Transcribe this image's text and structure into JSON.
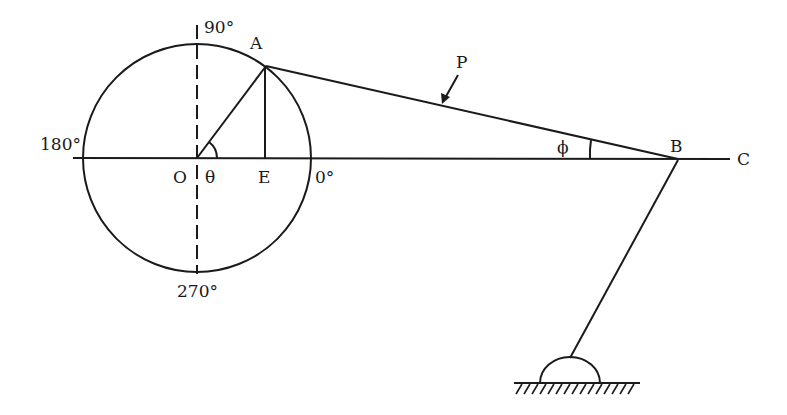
{
  "diagram": {
    "type": "slider-crank mechanism (crank circle with connecting rod and pivoted link)",
    "labels": {
      "deg90": "90°",
      "deg180": "180°",
      "deg270": "270°",
      "deg0": "0°",
      "A": "A",
      "O": "O",
      "theta": "θ",
      "E": "E",
      "P": "P",
      "phi": "ϕ",
      "B": "B",
      "C": "C"
    },
    "stroke_color": "#1a1a1a",
    "background": "#ffffff"
  }
}
